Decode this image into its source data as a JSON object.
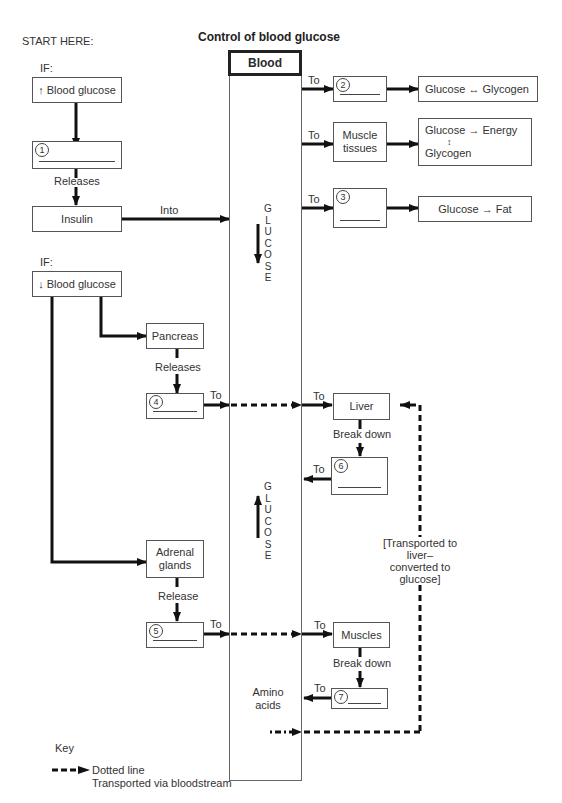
{
  "title": "Control of blood glucose",
  "start_label": "START HERE:",
  "high_branch": {
    "if_label": "IF:",
    "condition": "↑ Blood glucose",
    "blank1_number": "1",
    "releases_label": "Releases",
    "hormone": "Insulin",
    "into_label": "Into"
  },
  "blood": {
    "header": "Blood",
    "glucose_down_text": "GLUCOSE",
    "glucose_up_text": "GLUCOSE",
    "amino_acids": "Amino acids"
  },
  "targets_insulin": [
    {
      "to_label": "To",
      "blank_number": "2",
      "result": "Glucose ↔ Glycogen"
    },
    {
      "to_label": "To",
      "organ": "Muscle tissues",
      "result_line1": "Glucose → Energy",
      "result_arrow": "↕",
      "result_line2": "Glycogen"
    },
    {
      "to_label": "To",
      "blank_number": "3",
      "result": "Glucose → Fat"
    }
  ],
  "low_branch": {
    "if_label": "IF:",
    "condition": "↓ Blood glucose",
    "pancreas": "Pancreas",
    "pancreas_releases": "Releases",
    "blank4_number": "4",
    "to4_label": "To",
    "adrenal": "Adrenal glands",
    "adrenal_release": "Release",
    "blank5_number": "5",
    "to5_label": "To"
  },
  "liver_path": {
    "to_label": "To",
    "organ": "Liver",
    "break_down": "Break down",
    "blank6_to_label": "To",
    "blank6_number": "6"
  },
  "muscle_path": {
    "to_label": "To",
    "organ": "Muscles",
    "break_down": "Break down",
    "blank7_to_label": "To",
    "blank7_number": "7"
  },
  "transport_note": "[Transported to liver– converted to glucose]",
  "transport_note_lines": [
    "[Transported to liver–",
    "converted to",
    "glucose]"
  ],
  "key": {
    "title": "Key",
    "line1": "Dotted line",
    "line2": "Transported via bloodstream"
  }
}
